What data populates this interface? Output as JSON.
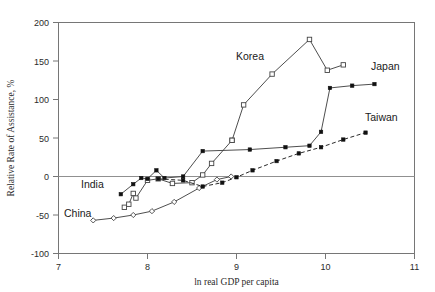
{
  "chart_data": {
    "type": "line",
    "title": "",
    "xlabel": "ln real GDP per capita",
    "ylabel": "Relative Rate of Assistance, %",
    "xlim": [
      7,
      11
    ],
    "ylim": [
      -100,
      200
    ],
    "xticks": [
      7,
      8,
      9,
      10,
      11
    ],
    "yticks": [
      -100,
      -50,
      0,
      50,
      100,
      150,
      200
    ],
    "grid": false,
    "legend": "inline-annotations",
    "zero_reference_line": 0,
    "series": [
      {
        "name": "China",
        "marker": "open-diamond",
        "line": "solid",
        "label_position": "lower-left",
        "points": [
          {
            "x": 7.39,
            "y": -57
          },
          {
            "x": 7.62,
            "y": -54
          },
          {
            "x": 7.84,
            "y": -50
          },
          {
            "x": 8.05,
            "y": -45
          },
          {
            "x": 8.3,
            "y": -33
          },
          {
            "x": 8.58,
            "y": -15
          },
          {
            "x": 8.78,
            "y": -4
          },
          {
            "x": 8.94,
            "y": 0
          }
        ]
      },
      {
        "name": "India",
        "marker": "open-square",
        "line": "solid",
        "label_position": "lower-left",
        "points": [
          {
            "x": 7.74,
            "y": -40
          },
          {
            "x": 7.79,
            "y": -36
          },
          {
            "x": 7.84,
            "y": -22
          },
          {
            "x": 7.87,
            "y": -28
          },
          {
            "x": 8.0,
            "y": -5
          },
          {
            "x": 8.12,
            "y": -3
          },
          {
            "x": 8.28,
            "y": -9
          },
          {
            "x": 8.5,
            "y": -8
          },
          {
            "x": 8.62,
            "y": 2
          },
          {
            "x": 8.72,
            "y": 17
          },
          {
            "x": 8.95,
            "y": 47
          }
        ]
      },
      {
        "name": "Korea",
        "marker": "open-square",
        "line": "solid",
        "label_position": "above-left",
        "points": [
          {
            "x": 8.95,
            "y": 47
          },
          {
            "x": 9.08,
            "y": 93
          },
          {
            "x": 9.4,
            "y": 133
          },
          {
            "x": 9.82,
            "y": 178
          },
          {
            "x": 10.02,
            "y": 138
          },
          {
            "x": 10.2,
            "y": 145
          }
        ]
      },
      {
        "name": "Japan",
        "marker": "filled-square",
        "line": "solid",
        "label_position": "right-top",
        "points": [
          {
            "x": 7.7,
            "y": -23
          },
          {
            "x": 7.84,
            "y": -10
          },
          {
            "x": 7.93,
            "y": -2
          },
          {
            "x": 8.0,
            "y": -3
          },
          {
            "x": 8.1,
            "y": 8
          },
          {
            "x": 8.19,
            "y": -2
          },
          {
            "x": 8.4,
            "y": 0
          },
          {
            "x": 8.62,
            "y": 33
          },
          {
            "x": 9.15,
            "y": 35
          },
          {
            "x": 9.55,
            "y": 38
          },
          {
            "x": 9.82,
            "y": 40
          },
          {
            "x": 9.95,
            "y": 58
          },
          {
            "x": 10.05,
            "y": 115
          },
          {
            "x": 10.3,
            "y": 118
          },
          {
            "x": 10.55,
            "y": 120
          }
        ]
      },
      {
        "name": "Taiwan",
        "marker": "filled-square",
        "line": "dashed",
        "label_position": "right-middle",
        "points": [
          {
            "x": 8.12,
            "y": -3
          },
          {
            "x": 8.4,
            "y": -5
          },
          {
            "x": 8.62,
            "y": -13
          },
          {
            "x": 8.84,
            "y": -8
          },
          {
            "x": 9.0,
            "y": -1
          },
          {
            "x": 9.18,
            "y": 8
          },
          {
            "x": 9.45,
            "y": 20
          },
          {
            "x": 9.7,
            "y": 30
          },
          {
            "x": 9.95,
            "y": 38
          },
          {
            "x": 10.2,
            "y": 48
          },
          {
            "x": 10.45,
            "y": 57
          }
        ]
      }
    ],
    "annotations": [
      {
        "text": "Korea",
        "x_px": 236,
        "y_px": 60
      },
      {
        "text": "Japan",
        "x_px": 371,
        "y_px": 70
      },
      {
        "text": "Taiwan",
        "x_px": 365,
        "y_px": 121
      },
      {
        "text": "India",
        "x_px": 81,
        "y_px": 188
      },
      {
        "text": "China",
        "x_px": 64,
        "y_px": 217
      }
    ]
  },
  "colors": {
    "frame": "#767676",
    "line": "#3a3a3a",
    "marker_fill": "#111111",
    "marker_open": "#ffffff",
    "text": "#1a1a1a",
    "background": "#ffffff"
  }
}
